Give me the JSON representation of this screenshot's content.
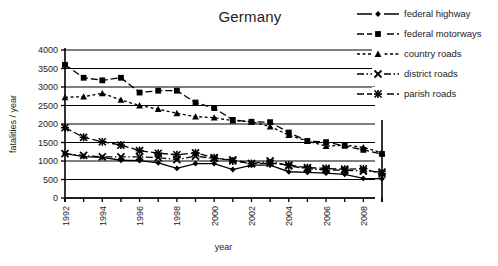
{
  "chart_data": {
    "type": "line",
    "title": "Germany",
    "xlabel": "year",
    "ylabel": "fatalities / year",
    "xlim": [
      1992,
      2009
    ],
    "ylim": [
      0,
      4000
    ],
    "ytick_step": 500,
    "yticks": [
      "0",
      "500",
      "1000",
      "1500",
      "2000",
      "2500",
      "3000",
      "3500",
      "4000"
    ],
    "xticks": [
      1992,
      1993,
      1994,
      1995,
      1996,
      1997,
      1998,
      1999,
      2000,
      2001,
      2002,
      2003,
      2004,
      2005,
      2006,
      2007,
      2008,
      2009
    ],
    "xtick_labels": [
      "1992",
      "",
      "1994",
      "",
      "1996",
      "",
      "1998",
      "",
      "2000",
      "",
      "2002",
      "",
      "2004",
      "",
      "2006",
      "",
      "2008",
      ""
    ],
    "grid": "horizontal",
    "legend_position": "right",
    "x": [
      1992,
      1993,
      1994,
      1995,
      1996,
      1997,
      1998,
      1999,
      2000,
      2001,
      2002,
      2003,
      2004,
      2005,
      2006,
      2007,
      2008,
      2009
    ],
    "series": [
      {
        "name": "federal highway",
        "marker": "diamond",
        "line_style": "solid",
        "color": "#000000",
        "values": [
          1200,
          1120,
          1100,
          1020,
          1010,
          950,
          800,
          930,
          930,
          770,
          890,
          890,
          710,
          690,
          670,
          640,
          530,
          520
        ]
      },
      {
        "name": "federal motorways",
        "marker": "square",
        "line_style": "dashed",
        "color": "#000000",
        "values": [
          3600,
          3250,
          3180,
          3250,
          2850,
          2900,
          2900,
          2580,
          2430,
          2110,
          2060,
          2050,
          1770,
          1540,
          1510,
          1410,
          1300,
          1190
        ]
      },
      {
        "name": "country roads",
        "marker": "triangle",
        "line_style": "dotted",
        "color": "#000000",
        "values": [
          2720,
          2740,
          2830,
          2650,
          2500,
          2400,
          2290,
          2200,
          2170,
          2090,
          2060,
          1930,
          1700,
          1540,
          1400,
          1430,
          1370,
          1220
        ]
      },
      {
        "name": "district roads",
        "marker": "cross",
        "line_style": "dashdot",
        "color": "#000000",
        "values": [
          1200,
          1150,
          1110,
          1110,
          1110,
          1090,
          1040,
          1130,
          1070,
          1030,
          930,
          1000,
          870,
          790,
          760,
          750,
          730,
          700
        ]
      },
      {
        "name": "parish roads",
        "marker": "asterisk",
        "line_style": "dashed",
        "color": "#000000",
        "values": [
          1900,
          1640,
          1520,
          1430,
          1280,
          1210,
          1170,
          1220,
          1090,
          1000,
          930,
          940,
          890,
          820,
          800,
          780,
          790,
          650
        ]
      }
    ]
  }
}
